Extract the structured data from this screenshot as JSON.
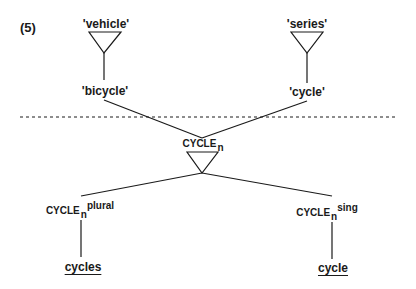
{
  "example_number": "(5)",
  "colors": {
    "ink": "#1a1a1a",
    "background": "#ffffff"
  },
  "semantic_level": {
    "left_top": {
      "gloss": "'vehicle'"
    },
    "left_bottom": {
      "gloss": "'bicycle'"
    },
    "right_top": {
      "gloss": "'series'"
    },
    "right_bottom": {
      "gloss": "'cycle'"
    }
  },
  "divider": {
    "style": "dashed"
  },
  "lexical_level": {
    "root": {
      "name": "CYCLE",
      "subscript": "n"
    },
    "left_child": {
      "name": "CYCLE",
      "subscript": "n",
      "superscript": "plural"
    },
    "right_child": {
      "name": "CYCLE",
      "subscript": "n",
      "superscript": "sing"
    }
  },
  "surface_forms": {
    "left": "cycles",
    "right": "cycle"
  }
}
